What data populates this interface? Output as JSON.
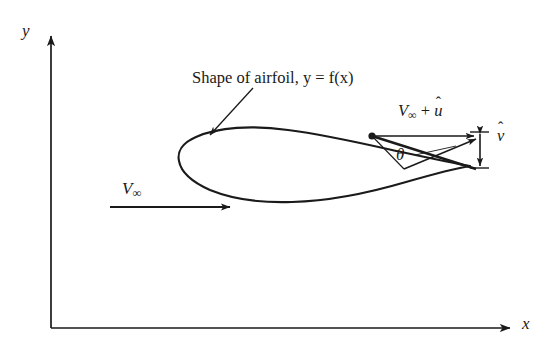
{
  "figure": {
    "type": "technical-diagram",
    "background_color": "#ffffff",
    "ink_color": "#1a1a1a"
  },
  "axes": {
    "y_label": "y",
    "x_label": "x",
    "origin": {
      "x": 51,
      "y": 328
    },
    "y_top": {
      "x": 51,
      "y": 34
    },
    "x_right": {
      "x": 512,
      "y": 328
    }
  },
  "labels": {
    "airfoil_caption": "Shape of airfoil, y = f(x)",
    "freestream": "V",
    "freestream_sub": "∞",
    "u_component_prefix": "V",
    "u_component_sub": "∞",
    "u_component_plus": " + ",
    "u_component_var": "u",
    "v_component_var": "v",
    "hat_mark": "ˆ",
    "theta": "θ"
  },
  "airfoil": {
    "leading_edge": {
      "x": 180,
      "y": 160
    },
    "trailing_edge": {
      "x": 470,
      "y": 166
    },
    "surface_point": {
      "x": 372,
      "y": 136
    },
    "chord_px": 290
  },
  "vectors": {
    "freestream_arrow": {
      "x1": 110,
      "y1": 207,
      "x2": 232,
      "y2": 207
    },
    "u_arrow": {
      "x1": 372,
      "y1": 136,
      "x2": 472,
      "y2": 136
    },
    "v_arrow": {
      "x": 479,
      "y1": 130,
      "y2": 168,
      "double_headed": true
    },
    "resultant_line": {
      "x1": 372,
      "y1": 136,
      "x2": 474,
      "y2": 168
    }
  },
  "annotation": {
    "leader_from": {
      "x": 252,
      "y": 88
    },
    "leader_to": {
      "x": 208,
      "y": 136
    }
  }
}
